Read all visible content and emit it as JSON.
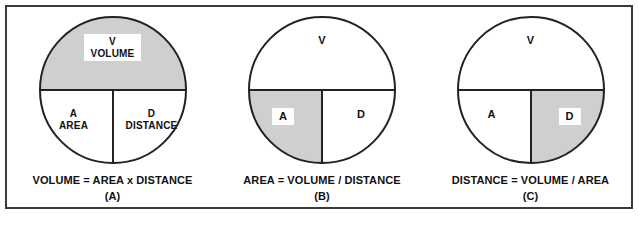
{
  "figure": {
    "border_color": "#3a3a3a",
    "background_color": "#ffffff",
    "highlight_color": "#cfcfcf",
    "line_color": "#222222"
  },
  "panels": [
    {
      "id": "A",
      "tag": "(A)",
      "equation": "VOLUME = AREA x DISTANCE",
      "highlight": "top",
      "segments": {
        "top": {
          "symbol": "V",
          "word": "VOLUME",
          "label": "V\nVOLUME",
          "boxed": true,
          "shaded": true
        },
        "left": {
          "symbol": "A",
          "word": "AREA",
          "label": "A\nAREA",
          "boxed": false,
          "shaded": false
        },
        "right": {
          "symbol": "D",
          "word": "DISTANCE",
          "label": "D\nDISTANCE",
          "boxed": false,
          "shaded": false
        }
      }
    },
    {
      "id": "B",
      "tag": "(B)",
      "equation": "AREA = VOLUME / DISTANCE",
      "highlight": "left",
      "segments": {
        "top": {
          "symbol": "V",
          "word": "",
          "label": "V",
          "boxed": false,
          "shaded": false
        },
        "left": {
          "symbol": "A",
          "word": "",
          "label": "A",
          "boxed": true,
          "shaded": true
        },
        "right": {
          "symbol": "D",
          "word": "",
          "label": "D",
          "boxed": false,
          "shaded": false
        }
      }
    },
    {
      "id": "C",
      "tag": "(C)",
      "equation": "DISTANCE = VOLUME / AREA",
      "highlight": "right",
      "segments": {
        "top": {
          "symbol": "V",
          "word": "",
          "label": "V",
          "boxed": false,
          "shaded": false
        },
        "left": {
          "symbol": "A",
          "word": "",
          "label": "A",
          "boxed": false,
          "shaded": false
        },
        "right": {
          "symbol": "D",
          "word": "",
          "label": "D",
          "boxed": true,
          "shaded": true
        }
      }
    }
  ]
}
